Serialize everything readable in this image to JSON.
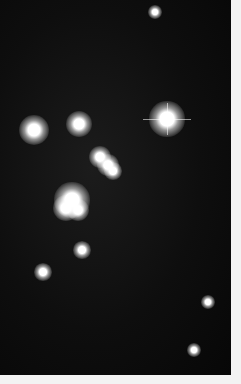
{
  "image": {
    "subject": "open star cluster photograph (black and white)",
    "width": 241,
    "height": 384,
    "border_color": "#f3f3f3",
    "sky_color": "#0a0a0a",
    "star_color": "#ffffff"
  },
  "bright_stars": [
    {
      "x": 34,
      "y": 130,
      "r": 7
    },
    {
      "x": 79,
      "y": 124,
      "r": 6
    },
    {
      "x": 167,
      "y": 119,
      "r": 8,
      "spikes": true
    },
    {
      "x": 100,
      "y": 157,
      "r": 5
    },
    {
      "x": 108,
      "y": 165,
      "r": 5
    },
    {
      "x": 113,
      "y": 171,
      "r": 4
    },
    {
      "x": 72,
      "y": 200,
      "r": 8
    },
    {
      "x": 66,
      "y": 208,
      "r": 6
    },
    {
      "x": 78,
      "y": 210,
      "r": 5
    },
    {
      "x": 43,
      "y": 272,
      "r": 4
    },
    {
      "x": 82,
      "y": 250,
      "r": 4
    },
    {
      "x": 155,
      "y": 12,
      "r": 3
    },
    {
      "x": 208,
      "y": 302,
      "r": 3
    },
    {
      "x": 194,
      "y": 350,
      "r": 3
    }
  ],
  "field_star_count": 420
}
